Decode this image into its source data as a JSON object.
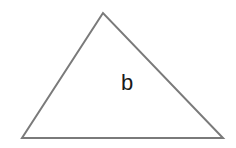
{
  "diagram": {
    "shape": "triangle",
    "vertices": [
      [
        103,
        13
      ],
      [
        22,
        138
      ],
      [
        223,
        138
      ]
    ],
    "stroke_color": "#7a7a7a",
    "stroke_width": 2,
    "label": "b"
  }
}
